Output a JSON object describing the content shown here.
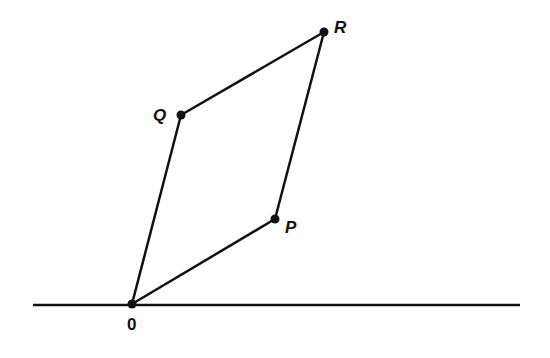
{
  "diagram": {
    "type": "parallelogram-vector-addition",
    "baseline": {
      "x1": 33,
      "y1": 305,
      "x2": 520,
      "y2": 305
    },
    "points": {
      "O": {
        "label": "0",
        "x": 132,
        "y": 304,
        "label_x": 127,
        "label_y": 330
      },
      "P": {
        "label": "P",
        "x": 275,
        "y": 219,
        "label_x": 285,
        "label_y": 233
      },
      "Q": {
        "label": "Q",
        "x": 181,
        "y": 115,
        "label_x": 153,
        "label_y": 121
      },
      "R": {
        "label": "R",
        "x": 324,
        "y": 32,
        "label_x": 334,
        "label_y": 33
      }
    },
    "edges": [
      [
        "O",
        "P"
      ],
      [
        "P",
        "R"
      ],
      [
        "R",
        "Q"
      ],
      [
        "Q",
        "O"
      ]
    ],
    "stroke_color": "#111111"
  },
  "labels": {
    "O": "0",
    "P": "P",
    "Q": "Q",
    "R": "R"
  }
}
